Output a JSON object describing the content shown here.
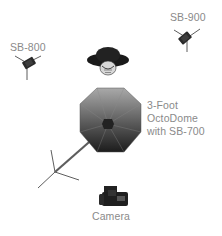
{
  "diagram": {
    "title": "",
    "elements": [
      {
        "id": "sb800",
        "type": "flash-on-stand",
        "label": "SB-800"
      },
      {
        "id": "sb900",
        "type": "flash-on-stand",
        "label": "SB-900"
      },
      {
        "id": "subject",
        "type": "person-with-hat-top-view",
        "label": ""
      },
      {
        "id": "octodome",
        "type": "octagonal-softbox-on-stand",
        "label_lines": [
          "3-Foot",
          "OctoDome",
          "with SB-700"
        ]
      },
      {
        "id": "camera",
        "type": "camera",
        "label": "Camera"
      }
    ]
  },
  "labels": {
    "sb800": "SB-800",
    "sb900": "SB-900",
    "octodome_line1": "3-Foot",
    "octodome_line2": "OctoDome",
    "octodome_line3": "with SB-700",
    "camera": "Camera"
  },
  "colors": {
    "text": "#8a8a8a",
    "stand": "#333333",
    "flash": "#2a2a2a",
    "octodome_light": "#a8a8a8",
    "octodome_dark": "#1e1e1e",
    "background": "#ffffff"
  }
}
